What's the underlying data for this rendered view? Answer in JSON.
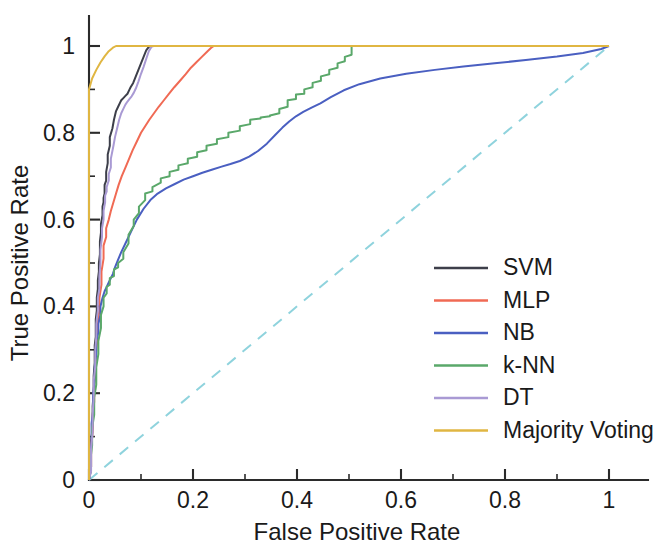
{
  "chart_data": {
    "type": "line",
    "title": "",
    "xlabel": "False Positive Rate",
    "ylabel": "True Positive Rate",
    "xlim": [
      0,
      1.08
    ],
    "ylim": [
      0,
      1.09
    ],
    "xticks": [
      "0",
      "0.2",
      "0.4",
      "0.6",
      "0.8",
      "1"
    ],
    "xtick_values": [
      0,
      0.2,
      0.4,
      0.6,
      0.8,
      1
    ],
    "yticks": [
      "0",
      "0.2",
      "0.4",
      "0.6",
      "0.8",
      "1"
    ],
    "ytick_values": [
      0,
      0.2,
      0.4,
      0.6,
      0.8,
      1
    ],
    "minor_tick_step": 0.1,
    "grid": false,
    "legend_position": "lower right",
    "reference_line": {
      "name": "chance-diagonal",
      "style": "dashed",
      "color": "#8fd3dd",
      "x": [
        0,
        1
      ],
      "y": [
        0,
        1
      ]
    },
    "series": [
      {
        "name": "SVM",
        "color": "#3d3f4a",
        "x": [
          0,
          0.004,
          0.004,
          0.007,
          0.007,
          0.009,
          0.009,
          0.011,
          0.011,
          0.013,
          0.013,
          0.015,
          0.015,
          0.017,
          0.017,
          0.019,
          0.019,
          0.021,
          0.021,
          0.023,
          0.023,
          0.026,
          0.026,
          0.028,
          0.028,
          0.03,
          0.03,
          0.033,
          0.033,
          0.036,
          0.036,
          0.04,
          0.04,
          0.045,
          0.048,
          0.052,
          0.056,
          0.06,
          0.062,
          0.066,
          0.07,
          0.074,
          0.078,
          0.08,
          0.085,
          0.09,
          0.095,
          0.1,
          0.105,
          0.11,
          0.115,
          0.12,
          0.122,
          1.0
        ],
        "y": [
          0,
          0.03,
          0.09,
          0.12,
          0.17,
          0.2,
          0.24,
          0.27,
          0.31,
          0.33,
          0.37,
          0.39,
          0.42,
          0.44,
          0.46,
          0.48,
          0.5,
          0.52,
          0.55,
          0.57,
          0.59,
          0.61,
          0.63,
          0.64,
          0.65,
          0.66,
          0.68,
          0.69,
          0.71,
          0.73,
          0.75,
          0.77,
          0.79,
          0.81,
          0.83,
          0.85,
          0.86,
          0.87,
          0.875,
          0.88,
          0.885,
          0.89,
          0.9,
          0.905,
          0.915,
          0.93,
          0.945,
          0.96,
          0.975,
          0.99,
          0.998,
          1.0,
          1.0,
          1.0
        ]
      },
      {
        "name": "MLP",
        "color": "#f06a54",
        "x": [
          0,
          0.004,
          0.004,
          0.007,
          0.007,
          0.01,
          0.01,
          0.013,
          0.013,
          0.016,
          0.016,
          0.02,
          0.02,
          0.024,
          0.024,
          0.028,
          0.028,
          0.033,
          0.033,
          0.038,
          0.042,
          0.047,
          0.052,
          0.057,
          0.063,
          0.07,
          0.077,
          0.084,
          0.092,
          0.1,
          0.108,
          0.116,
          0.125,
          0.134,
          0.144,
          0.154,
          0.164,
          0.175,
          0.186,
          0.196,
          0.207,
          0.217,
          0.228,
          0.236,
          0.24,
          1.0
        ],
        "y": [
          0,
          0.03,
          0.08,
          0.11,
          0.15,
          0.18,
          0.22,
          0.25,
          0.29,
          0.32,
          0.36,
          0.39,
          0.42,
          0.45,
          0.48,
          0.51,
          0.54,
          0.56,
          0.58,
          0.6,
          0.62,
          0.64,
          0.66,
          0.68,
          0.7,
          0.72,
          0.74,
          0.76,
          0.78,
          0.8,
          0.815,
          0.83,
          0.845,
          0.86,
          0.875,
          0.89,
          0.905,
          0.92,
          0.935,
          0.95,
          0.963,
          0.975,
          0.988,
          0.997,
          1.0,
          1.0
        ]
      },
      {
        "name": "NB",
        "color": "#4a5fc1",
        "x": [
          0,
          0.003,
          0.003,
          0.005,
          0.005,
          0.008,
          0.008,
          0.011,
          0.011,
          0.014,
          0.014,
          0.018,
          0.018,
          0.022,
          0.022,
          0.026,
          0.03,
          0.034,
          0.038,
          0.042,
          0.046,
          0.05,
          0.055,
          0.062,
          0.07,
          0.08,
          0.092,
          0.105,
          0.118,
          0.132,
          0.148,
          0.165,
          0.182,
          0.2,
          0.218,
          0.236,
          0.255,
          0.272,
          0.29,
          0.308,
          0.325,
          0.342,
          0.358,
          0.372,
          0.385,
          0.398,
          0.412,
          0.428,
          0.445,
          0.465,
          0.49,
          0.52,
          0.56,
          0.61,
          0.665,
          0.72,
          0.78,
          0.84,
          0.9,
          0.95,
          0.985,
          1.0
        ],
        "y": [
          0,
          0.02,
          0.06,
          0.09,
          0.13,
          0.16,
          0.2,
          0.23,
          0.26,
          0.29,
          0.32,
          0.34,
          0.36,
          0.38,
          0.4,
          0.42,
          0.435,
          0.445,
          0.455,
          0.465,
          0.475,
          0.49,
          0.505,
          0.525,
          0.545,
          0.57,
          0.6,
          0.625,
          0.645,
          0.66,
          0.672,
          0.682,
          0.692,
          0.7,
          0.708,
          0.715,
          0.722,
          0.728,
          0.735,
          0.745,
          0.758,
          0.775,
          0.795,
          0.812,
          0.826,
          0.838,
          0.848,
          0.858,
          0.868,
          0.882,
          0.898,
          0.912,
          0.925,
          0.936,
          0.945,
          0.953,
          0.96,
          0.968,
          0.976,
          0.984,
          0.993,
          1.0
        ]
      },
      {
        "name": "k-NN",
        "color": "#5aa86a",
        "x": [
          0,
          0.003,
          0.003,
          0.006,
          0.006,
          0.01,
          0.01,
          0.014,
          0.014,
          0.018,
          0.018,
          0.023,
          0.023,
          0.028,
          0.028,
          0.034,
          0.034,
          0.04,
          0.04,
          0.048,
          0.048,
          0.056,
          0.056,
          0.066,
          0.066,
          0.076,
          0.076,
          0.086,
          0.086,
          0.096,
          0.096,
          0.108,
          0.108,
          0.122,
          0.122,
          0.138,
          0.138,
          0.155,
          0.155,
          0.172,
          0.172,
          0.19,
          0.19,
          0.208,
          0.208,
          0.226,
          0.226,
          0.246,
          0.246,
          0.268,
          0.268,
          0.29,
          0.29,
          0.31,
          0.31,
          0.33,
          0.33,
          0.348,
          0.348,
          0.366,
          0.366,
          0.382,
          0.382,
          0.398,
          0.398,
          0.414,
          0.414,
          0.43,
          0.43,
          0.446,
          0.446,
          0.462,
          0.462,
          0.478,
          0.478,
          0.492,
          0.492,
          0.505,
          0.505,
          1.0
        ],
        "y": [
          0,
          0.02,
          0.05,
          0.08,
          0.12,
          0.15,
          0.19,
          0.22,
          0.26,
          0.29,
          0.32,
          0.35,
          0.38,
          0.4,
          0.42,
          0.43,
          0.445,
          0.45,
          0.465,
          0.47,
          0.485,
          0.49,
          0.5,
          0.51,
          0.525,
          0.545,
          0.565,
          0.585,
          0.6,
          0.615,
          0.63,
          0.645,
          0.66,
          0.665,
          0.675,
          0.685,
          0.695,
          0.7,
          0.71,
          0.715,
          0.725,
          0.73,
          0.74,
          0.745,
          0.755,
          0.76,
          0.77,
          0.775,
          0.785,
          0.79,
          0.8,
          0.805,
          0.815,
          0.82,
          0.83,
          0.833,
          0.835,
          0.838,
          0.84,
          0.845,
          0.855,
          0.86,
          0.875,
          0.878,
          0.888,
          0.89,
          0.9,
          0.905,
          0.915,
          0.92,
          0.93,
          0.935,
          0.945,
          0.95,
          0.96,
          0.965,
          0.975,
          0.98,
          1.0,
          1.0
        ]
      },
      {
        "name": "DT",
        "color": "#a99ad4",
        "x": [
          0,
          0.004,
          0.004,
          0.007,
          0.007,
          0.009,
          0.009,
          0.012,
          0.012,
          0.014,
          0.014,
          0.017,
          0.017,
          0.02,
          0.02,
          0.022,
          0.022,
          0.025,
          0.025,
          0.028,
          0.028,
          0.031,
          0.031,
          0.034,
          0.034,
          0.038,
          0.038,
          0.042,
          0.042,
          0.047,
          0.05,
          0.054,
          0.058,
          0.062,
          0.066,
          0.07,
          0.074,
          0.078,
          0.082,
          0.086,
          0.09,
          0.095,
          0.1,
          0.105,
          0.11,
          0.115,
          0.12,
          0.124,
          1.0
        ],
        "y": [
          0,
          0.02,
          0.07,
          0.11,
          0.15,
          0.19,
          0.23,
          0.26,
          0.3,
          0.33,
          0.36,
          0.39,
          0.42,
          0.44,
          0.47,
          0.5,
          0.53,
          0.56,
          0.58,
          0.6,
          0.62,
          0.64,
          0.655,
          0.665,
          0.675,
          0.69,
          0.705,
          0.72,
          0.74,
          0.77,
          0.79,
          0.81,
          0.83,
          0.845,
          0.855,
          0.865,
          0.872,
          0.878,
          0.884,
          0.892,
          0.902,
          0.918,
          0.936,
          0.952,
          0.97,
          0.988,
          0.998,
          1.0,
          1.0
        ]
      },
      {
        "name": "Majority Voting",
        "color": "#e0b642",
        "x": [
          0,
          0.0,
          0.006,
          0.014,
          0.022,
          0.03,
          0.038,
          0.046,
          0.052,
          1.0
        ],
        "y": [
          0,
          0.9,
          0.925,
          0.945,
          0.962,
          0.976,
          0.988,
          0.996,
          1.0,
          1.0
        ]
      }
    ]
  },
  "legend": {
    "entries": [
      {
        "label": "SVM"
      },
      {
        "label": "MLP"
      },
      {
        "label": "NB"
      },
      {
        "label": "k-NN"
      },
      {
        "label": "DT"
      },
      {
        "label": "Majority Voting"
      }
    ]
  }
}
